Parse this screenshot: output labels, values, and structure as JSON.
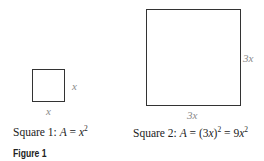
{
  "figure": {
    "label": "Figure 1",
    "square1": {
      "side_right": "x",
      "side_bottom": "x",
      "caption_prefix": "Square 1:  ",
      "caption_A": "A",
      "caption_eq": " = ",
      "caption_var": "x",
      "caption_exp": "2"
    },
    "square2": {
      "side_right": "3x",
      "side_bottom": "3x",
      "caption_prefix": "Square 2:  ",
      "caption_A": "A",
      "caption_eq1": " = (3",
      "caption_var1": "x",
      "caption_close": ")",
      "caption_exp1": "2",
      "caption_eq2": " = 9",
      "caption_var2": "x",
      "caption_exp2": "2"
    }
  }
}
